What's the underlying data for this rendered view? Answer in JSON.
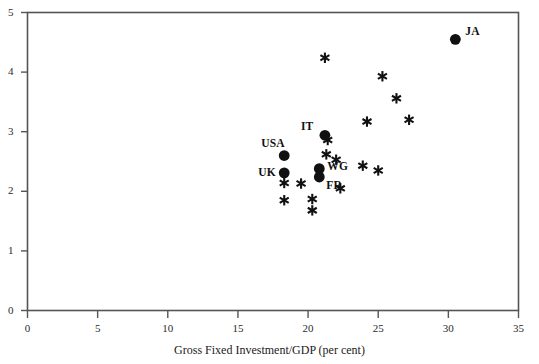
{
  "chart_data": {
    "type": "scatter",
    "title": "",
    "xlabel": "Gross Fixed Investment/GDP (per cent)",
    "ylabel": "",
    "xlim": [
      0,
      35
    ],
    "ylim": [
      0,
      5
    ],
    "xticks": [
      0,
      5,
      10,
      15,
      20,
      25,
      30,
      35
    ],
    "yticks": [
      0,
      1,
      2,
      3,
      4,
      5
    ],
    "xticklabels": [
      "0",
      "5",
      "10",
      "15",
      "20",
      "25",
      "30",
      "35"
    ],
    "yticklabels": [
      "0",
      "1",
      "2",
      "3",
      "4",
      "5"
    ],
    "grid": false,
    "legend": null,
    "marker_colors": {
      "filled_circle": "#111111",
      "asterisk": "#111111"
    },
    "axis_color": "#555555",
    "series": [
      {
        "name": "labelled-countries",
        "marker": "filled-circle",
        "points": [
          {
            "label": "JA",
            "x": 30.5,
            "y": 4.55
          },
          {
            "label": "IT",
            "x": 21.2,
            "y": 2.94
          },
          {
            "label": "USA",
            "x": 18.3,
            "y": 2.6
          },
          {
            "label": "UK",
            "x": 18.3,
            "y": 2.31
          },
          {
            "label": "WG",
            "x": 20.8,
            "y": 2.38
          },
          {
            "label": "FR",
            "x": 20.8,
            "y": 2.24
          }
        ]
      },
      {
        "name": "unlabelled-countries",
        "marker": "asterisk",
        "points": [
          {
            "x": 21.2,
            "y": 4.24
          },
          {
            "x": 25.3,
            "y": 3.93
          },
          {
            "x": 26.3,
            "y": 3.56
          },
          {
            "x": 24.2,
            "y": 3.17
          },
          {
            "x": 27.2,
            "y": 3.2
          },
          {
            "x": 21.4,
            "y": 2.86
          },
          {
            "x": 21.3,
            "y": 2.62
          },
          {
            "x": 22.0,
            "y": 2.53
          },
          {
            "x": 23.9,
            "y": 2.43
          },
          {
            "x": 25.0,
            "y": 2.35
          },
          {
            "x": 18.3,
            "y": 2.14
          },
          {
            "x": 19.5,
            "y": 2.13
          },
          {
            "x": 22.3,
            "y": 2.05
          },
          {
            "x": 18.3,
            "y": 1.85
          },
          {
            "x": 20.3,
            "y": 1.87
          },
          {
            "x": 20.3,
            "y": 1.68
          }
        ]
      }
    ]
  },
  "axis": {
    "x_title": "Gross Fixed Investment/GDP (per cent)"
  },
  "labels": {
    "ja": "JA",
    "it": "IT",
    "usa": "USA",
    "uk": "UK",
    "wg": "WG",
    "fr": "FR"
  }
}
